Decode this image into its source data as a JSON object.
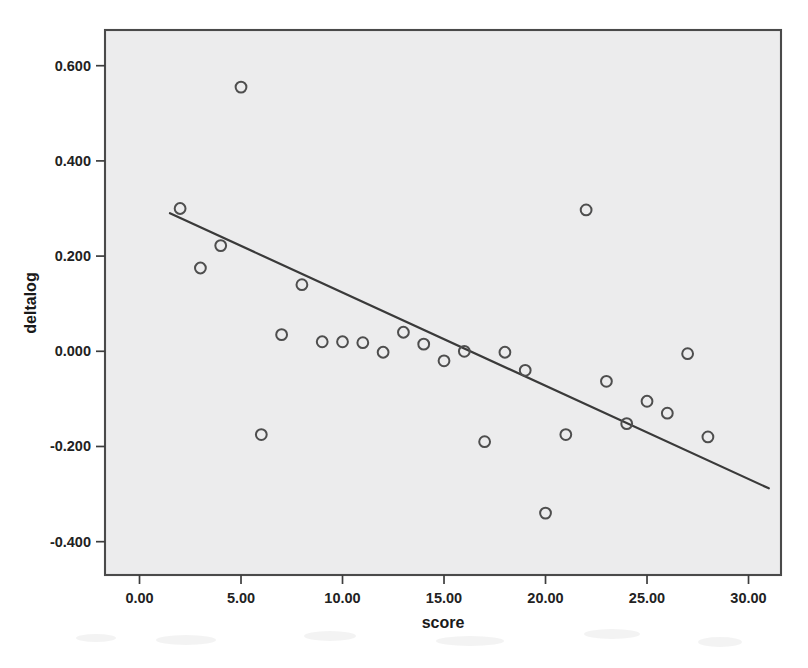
{
  "chart_data": {
    "type": "scatter",
    "title": "",
    "xlabel": "score",
    "ylabel": "deltalog",
    "xlim": [
      -1.7,
      31.6
    ],
    "ylim": [
      -0.47,
      0.675
    ],
    "grid": false,
    "legend": "none",
    "x_ticks": [
      "0.00",
      "5.00",
      "10.00",
      "15.00",
      "20.00",
      "25.00",
      "30.00"
    ],
    "x_tick_values": [
      0,
      5,
      10,
      15,
      20,
      25,
      30
    ],
    "y_ticks": [
      "0.600",
      "0.400",
      "0.200",
      "0.000",
      "-0.200",
      "-0.400"
    ],
    "y_tick_values": [
      0.6,
      0.4,
      0.2,
      0.0,
      -0.2,
      -0.4
    ],
    "marker": "open-circle",
    "marker_color": "#4e4e4e",
    "plot_background": "#ececed",
    "points": [
      {
        "x": 2,
        "y": 0.3
      },
      {
        "x": 3,
        "y": 0.175
      },
      {
        "x": 4,
        "y": 0.222
      },
      {
        "x": 5,
        "y": 0.555
      },
      {
        "x": 6,
        "y": -0.175
      },
      {
        "x": 7,
        "y": 0.035
      },
      {
        "x": 8,
        "y": 0.14
      },
      {
        "x": 9,
        "y": 0.02
      },
      {
        "x": 10,
        "y": 0.02
      },
      {
        "x": 11,
        "y": 0.018
      },
      {
        "x": 12,
        "y": -0.002
      },
      {
        "x": 13,
        "y": 0.04
      },
      {
        "x": 14,
        "y": 0.015
      },
      {
        "x": 15,
        "y": -0.02
      },
      {
        "x": 16,
        "y": 0.0
      },
      {
        "x": 17,
        "y": -0.19
      },
      {
        "x": 18,
        "y": -0.002
      },
      {
        "x": 19,
        "y": -0.04
      },
      {
        "x": 20,
        "y": -0.34
      },
      {
        "x": 21,
        "y": -0.175
      },
      {
        "x": 22,
        "y": 0.297
      },
      {
        "x": 23,
        "y": -0.063
      },
      {
        "x": 24,
        "y": -0.152
      },
      {
        "x": 25,
        "y": -0.105
      },
      {
        "x": 26,
        "y": -0.13
      },
      {
        "x": 27,
        "y": -0.005
      },
      {
        "x": 28,
        "y": -0.18
      }
    ],
    "fit_line": {
      "name": "linear-fit",
      "x_start": 1.5,
      "y_start": 0.29,
      "x_end": 31.0,
      "y_end": -0.288
    }
  }
}
